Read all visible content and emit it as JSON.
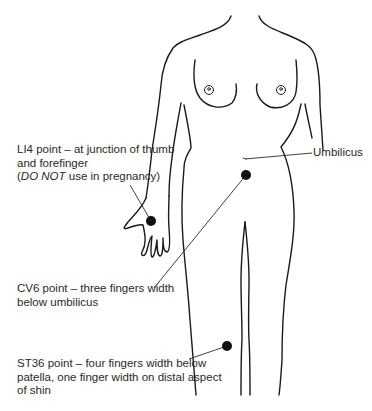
{
  "figure": {
    "colors": {
      "outline": "#1a1a1a",
      "point": "#111111",
      "text": "#2a2a2a",
      "background": "#ffffff"
    }
  },
  "labels": {
    "li4": {
      "line1": "LI4 point – at junction of thumb",
      "line2": "and forefinger",
      "line3_open": "(",
      "line3_em": "DO NOT",
      "line3_rest": " use in pregnancy)"
    },
    "umbilicus": {
      "text": "Umbilicus"
    },
    "cv6": {
      "line1": "CV6 point – three fingers width",
      "line2": "below umbilicus"
    },
    "st36": {
      "line1": "ST36 point – four fingers width below",
      "line2": "patella, one finger width on distal aspect",
      "line3": "of shin"
    }
  },
  "points": [
    {
      "name": "LI4",
      "x": 151,
      "y": 221
    },
    {
      "name": "CV6",
      "x": 246,
      "y": 175
    },
    {
      "name": "ST36",
      "x": 227,
      "y": 346
    }
  ]
}
